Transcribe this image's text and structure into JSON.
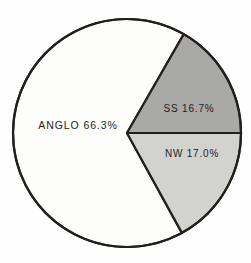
{
  "chart_data": {
    "type": "pie",
    "title": "",
    "subtitle": "",
    "xlabel": "",
    "ylabel": "",
    "grid": false,
    "legend": "none",
    "labels_inline": true,
    "total_percent": 100.0,
    "categories": [
      "ANGLO",
      "SS",
      "NW"
    ],
    "values": [
      66.3,
      16.7,
      17.0
    ],
    "slices": [
      {
        "name": "ANGLO",
        "value": 66.3,
        "value_text": "66.3%",
        "label_text": "ANGLO 66.3%",
        "color": "#fdfdfb",
        "stroke": "#231f1c",
        "start_angle_deg": 21.0,
        "end_angle_deg": 339.7,
        "label_x": 78,
        "label_y": 129
      },
      {
        "name": "SS",
        "value": 16.7,
        "value_text": "16.7%",
        "label_text": "SS  16.7%",
        "color": "#a9a9a7",
        "stroke": "#231f1c",
        "start_angle_deg": 339.7,
        "end_angle_deg": 360.0,
        "label_x": 189,
        "label_y": 112
      },
      {
        "name": "NW",
        "value": 17.0,
        "value_text": "17.0%",
        "label_text": "NW  17.0%",
        "color": "#d2d2cf",
        "stroke": "#231f1c",
        "start_angle_deg": 0.0,
        "end_angle_deg": 21.0,
        "label_x": 192,
        "label_y": 157
      }
    ],
    "geometry": {
      "center_x": 127,
      "center_y": 133,
      "radius": 114,
      "outline_color": "#231f1c",
      "outline_width": 2.2,
      "divider_color": "#231f1c",
      "background": "#fefefe"
    }
  }
}
